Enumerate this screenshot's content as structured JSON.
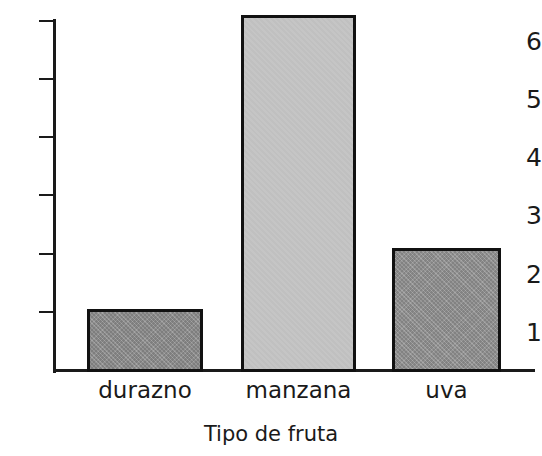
{
  "chart_data": {
    "type": "bar",
    "title": "",
    "subtitle": "",
    "xlabel": "Tipo de fruta",
    "ylabel": "",
    "categories": [
      "durazno",
      "manzana",
      "uva"
    ],
    "values": [
      1.05,
      6.1,
      2.1
    ],
    "ylim": [
      0,
      6.45
    ],
    "y_ticks": [
      1,
      2,
      3,
      4,
      5,
      6
    ],
    "y_tick_labels": [
      "1",
      "2",
      "3",
      "4",
      "5",
      "6"
    ],
    "grid": false,
    "legend": null,
    "legend_position": "none",
    "annotations": [],
    "bar_colors": [
      "#8a8a8a",
      "#c2c2c2",
      "#8f8f8f"
    ],
    "bar_edge_color": "#111111",
    "axis_color": "#1a1a1a",
    "background_color": "#ffffff",
    "note": "Top of the manzana bar is clipped by the top edge of the figure"
  }
}
